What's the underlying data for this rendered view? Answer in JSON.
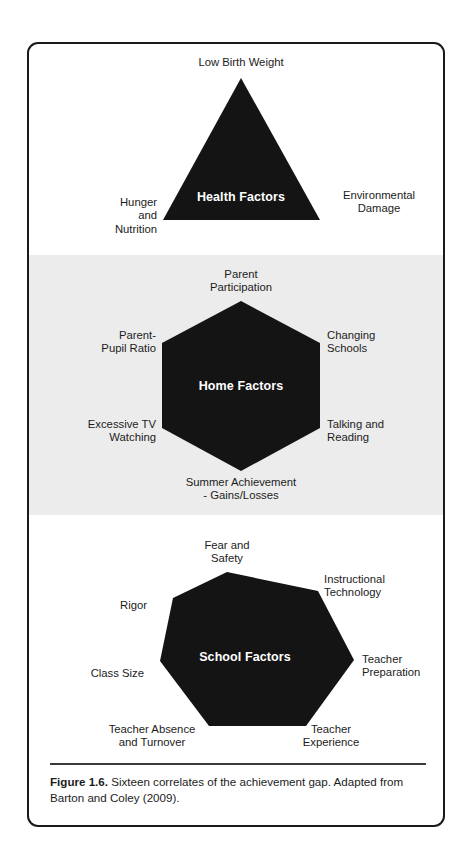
{
  "figure": {
    "caption_label": "Figure 1.6.",
    "caption_text": " Sixteen correlates of the achievement gap. Adapted from Barton and Coley (2009)."
  },
  "clusters": [
    {
      "id": "health",
      "shape": "triangle",
      "title": "Health Factors",
      "background": "#ffffff",
      "fill": "#141414",
      "nodes": [
        {
          "label": "Low Birth Weight",
          "position": "top"
        },
        {
          "label": "Hunger\nand\nNutrition",
          "position": "bottom-left"
        },
        {
          "label": "Environmental\nDamage",
          "position": "bottom-right"
        }
      ]
    },
    {
      "id": "home",
      "shape": "hexagon",
      "title": "Home Factors",
      "background": "#ececec",
      "fill": "#141414",
      "nodes": [
        {
          "label": "Parent\nParticipation",
          "position": "top"
        },
        {
          "label": "Parent-\nPupil Ratio",
          "position": "upper-left"
        },
        {
          "label": "Changing\nSchools",
          "position": "upper-right"
        },
        {
          "label": "Excessive TV\nWatching",
          "position": "lower-left"
        },
        {
          "label": "Talking and\nReading",
          "position": "lower-right"
        },
        {
          "label": "Summer Achievement\n- Gains/Losses",
          "position": "bottom"
        }
      ]
    },
    {
      "id": "school",
      "shape": "heptagon",
      "title": "School Factors",
      "background": "#ffffff",
      "fill": "#141414",
      "nodes": [
        {
          "label": "Fear and\nSafety",
          "position": "top"
        },
        {
          "label": "Instructional\nTechnology",
          "position": "upper-right"
        },
        {
          "label": "Rigor",
          "position": "upper-left"
        },
        {
          "label": "Teacher\nPreparation",
          "position": "right"
        },
        {
          "label": "Class Size",
          "position": "left"
        },
        {
          "label": "Teacher Absence\nand Turnover",
          "position": "bottom-left"
        },
        {
          "label": "Teacher\nExperience",
          "position": "bottom-right"
        }
      ]
    }
  ]
}
